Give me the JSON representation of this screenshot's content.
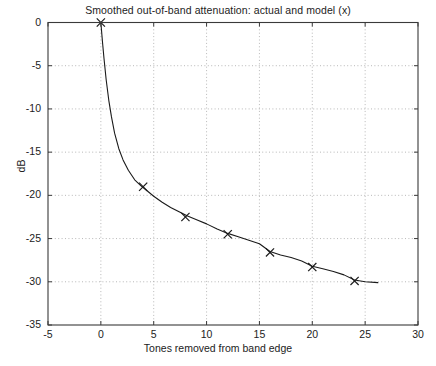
{
  "chart_data": {
    "type": "line",
    "title": "Smoothed out-of-band attenuation: actual and model (x)",
    "xlabel": "Tones removed from band edge",
    "ylabel": "dB",
    "xlim": [
      -5,
      30
    ],
    "ylim": [
      -35,
      0
    ],
    "xticks": [
      -5,
      0,
      5,
      10,
      15,
      20,
      25,
      30
    ],
    "xtick_labels": [
      "-5",
      "0",
      "5",
      "10",
      "15",
      "20",
      "25",
      "30"
    ],
    "yticks": [
      -35,
      -30,
      -25,
      -20,
      -15,
      -10,
      -5,
      0
    ],
    "ytick_labels": [
      "-35",
      "-30",
      "-25",
      "-20",
      "-15",
      "-10",
      "-5",
      "0"
    ],
    "grid": true,
    "grid_style": "dotted",
    "legend": null,
    "series": [
      {
        "name": "model",
        "marker": "x",
        "line": "none",
        "color": "#1a1a1a",
        "x": [
          0,
          4,
          8,
          12,
          16,
          20,
          24
        ],
        "y": [
          0,
          -19.0,
          -22.5,
          -24.5,
          -26.6,
          -28.3,
          -29.9
        ]
      },
      {
        "name": "actual",
        "marker": "none",
        "line": "solid",
        "color": "#1a1a1a",
        "x": [
          0.0,
          0.15,
          0.3,
          0.5,
          0.75,
          1.0,
          1.3,
          1.7,
          2.1,
          2.6,
          3.2,
          3.8,
          4.4,
          5.0,
          5.8,
          6.6,
          7.4,
          8.2,
          9.0,
          10.0,
          11.0,
          12.0,
          13.0,
          14.0,
          15.0,
          16.0,
          17.0,
          18.0,
          19.0,
          20.0,
          21.0,
          22.0,
          23.0,
          24.0,
          25.0,
          26.2
        ],
        "y": [
          0.0,
          -2.2,
          -4.2,
          -6.6,
          -9.0,
          -10.9,
          -12.8,
          -14.6,
          -15.9,
          -17.1,
          -18.2,
          -18.9,
          -19.5,
          -20.1,
          -20.8,
          -21.4,
          -21.9,
          -22.4,
          -22.8,
          -23.3,
          -23.9,
          -24.4,
          -24.8,
          -25.2,
          -25.6,
          -26.5,
          -26.9,
          -27.2,
          -27.6,
          -28.2,
          -28.5,
          -28.8,
          -29.2,
          -29.8,
          -30.0,
          -30.1
        ]
      }
    ]
  },
  "figure": {
    "background": "#ffffff",
    "axis_color": "#3a3a3a",
    "grid_color": "#9a9a9a"
  }
}
